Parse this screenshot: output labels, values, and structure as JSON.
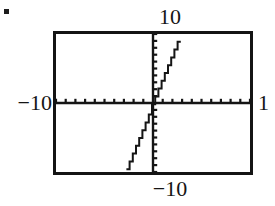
{
  "figure": {
    "bullet": "▪",
    "labels": {
      "top": "10",
      "left": "−10",
      "right": "1",
      "bottom": "−10"
    }
  },
  "chart_data": {
    "type": "line",
    "title": "",
    "subtitle": "",
    "xlabel": "",
    "ylabel": "",
    "xlim": [
      -10,
      10
    ],
    "ylim": [
      -10,
      10
    ],
    "grid": false,
    "legend": false,
    "legend_position": "none",
    "axis_style": "graphing-calculator-window",
    "x_tick_labels": [
      "−10",
      "1"
    ],
    "y_tick_labels": [
      "10",
      "−10"
    ],
    "x_tick_spacing": 1,
    "y_tick_spacing": 1,
    "x_ticks": [
      -10,
      -9,
      -8,
      -7,
      -6,
      -5,
      -4,
      -3,
      -2,
      -1,
      0,
      1,
      2,
      3,
      4,
      5,
      6,
      7,
      8,
      9,
      10
    ],
    "y_ticks": [
      -10,
      -9,
      -8,
      -7,
      -6,
      -5,
      -4,
      -3,
      -2,
      -1,
      0,
      1,
      2,
      3,
      4,
      5,
      6,
      7,
      8,
      9,
      10
    ],
    "series": [
      {
        "name": "line",
        "equation": "y = 3.5x",
        "slope": 3.5,
        "intercept": 0,
        "color": "#151515",
        "x": [
          -2.9,
          -2.5,
          -2.0,
          -1.5,
          -1.0,
          -0.5,
          0.0,
          0.5,
          1.0,
          1.5,
          2.0,
          2.5,
          2.9
        ],
        "values": [
          -10.0,
          -8.75,
          -7.0,
          -5.25,
          -3.5,
          -1.75,
          0.0,
          1.75,
          3.5,
          5.25,
          7.0,
          8.75,
          10.0
        ]
      }
    ],
    "annotations": []
  },
  "colors": {
    "frame": "#141414",
    "axis": "#151515",
    "curve": "#151515",
    "text": "#151515",
    "background": "#ffffff"
  }
}
